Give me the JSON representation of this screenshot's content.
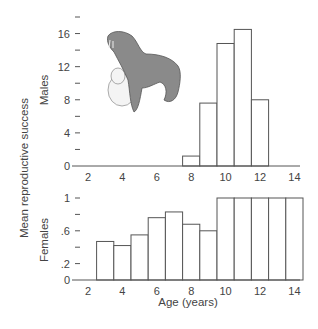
{
  "chart_data": [
    {
      "type": "bar",
      "panel": "top",
      "title": "",
      "series_label": "Males",
      "xlabel": "",
      "ylabel": "Mean reproductive success",
      "ylim": [
        0,
        18
      ],
      "yticks_major": [
        0,
        4,
        8,
        12,
        16
      ],
      "yticks_minor": [
        2,
        6,
        10,
        14,
        18
      ],
      "ytick_labels": [
        "0",
        "4",
        "8",
        "12",
        "16"
      ],
      "xlim": [
        1,
        15
      ],
      "xticks": [
        2,
        4,
        6,
        8,
        10,
        12,
        14
      ],
      "xtick_labels": [
        "2",
        "4",
        "6",
        "8",
        "10",
        "12",
        "14"
      ],
      "categories": [
        8,
        9,
        10,
        11,
        12
      ],
      "values": [
        1.2,
        7.6,
        14.8,
        16.5,
        8.0
      ],
      "grid": false,
      "illustration": "seal-mother-and-pup"
    },
    {
      "type": "bar",
      "panel": "bottom",
      "title": "",
      "series_label": "Females",
      "xlabel": "Age (years)",
      "ylabel": "Mean reproductive success",
      "ylim": [
        0,
        1
      ],
      "yticks_major": [
        0,
        0.2,
        0.6,
        1
      ],
      "yticks_minor": [
        0.4,
        0.8
      ],
      "ytick_labels": [
        "0",
        ".2",
        ".6",
        "1"
      ],
      "xlim": [
        1,
        15
      ],
      "xticks": [
        2,
        4,
        6,
        8,
        10,
        12,
        14
      ],
      "xtick_labels": [
        "2",
        "4",
        "6",
        "8",
        "10",
        "12",
        "14"
      ],
      "categories": [
        3,
        4,
        5,
        6,
        7,
        8,
        9,
        10,
        11,
        12,
        13,
        14
      ],
      "values": [
        0.47,
        0.42,
        0.55,
        0.76,
        0.83,
        0.68,
        0.6,
        1.0,
        1.0,
        1.0,
        1.0,
        1.0
      ],
      "grid": false
    }
  ],
  "labels": {
    "ylabel": "Mean reproductive success",
    "males": "Males",
    "females": "Females",
    "xlabel": "Age (years)"
  }
}
